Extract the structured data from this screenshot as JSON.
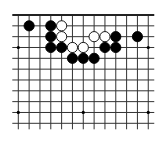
{
  "diagram": {
    "type": "go-board-fragment",
    "columns": 13,
    "rows": 11,
    "top_edge": true,
    "origin_x": 18.3,
    "origin_y": 15,
    "spacing": 10.83,
    "colors": {
      "line": "#333333",
      "edge": "#222222",
      "black": "#000000",
      "white": "#ffffff",
      "background": "#ffffff"
    },
    "star_points": [
      [
        0,
        3
      ],
      [
        6,
        3
      ],
      [
        12,
        3
      ],
      [
        0,
        9
      ],
      [
        6,
        9
      ],
      [
        12,
        9
      ]
    ],
    "stones": [
      {
        "color": "black",
        "col": 1,
        "row": 1
      },
      {
        "color": "black",
        "col": 3,
        "row": 1
      },
      {
        "color": "white",
        "col": 4,
        "row": 1
      },
      {
        "color": "black",
        "col": 3,
        "row": 2
      },
      {
        "color": "white",
        "col": 4,
        "row": 2
      },
      {
        "color": "white",
        "col": 7,
        "row": 2
      },
      {
        "color": "white",
        "col": 8,
        "row": 2
      },
      {
        "color": "black",
        "col": 9,
        "row": 2
      },
      {
        "color": "black",
        "col": 11,
        "row": 2
      },
      {
        "color": "black",
        "col": 3,
        "row": 3
      },
      {
        "color": "black",
        "col": 4,
        "row": 3
      },
      {
        "color": "white",
        "col": 5,
        "row": 3
      },
      {
        "color": "white",
        "col": 6,
        "row": 3
      },
      {
        "color": "black",
        "col": 8,
        "row": 3
      },
      {
        "color": "black",
        "col": 9,
        "row": 3
      },
      {
        "color": "black",
        "col": 5,
        "row": 4
      },
      {
        "color": "black",
        "col": 6,
        "row": 4
      },
      {
        "color": "black",
        "col": 7,
        "row": 4
      }
    ]
  }
}
